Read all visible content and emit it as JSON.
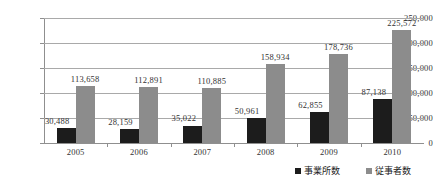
{
  "chart_data": {
    "type": "bar",
    "title": "",
    "subtitle": "",
    "xlabel": "",
    "ylabel": "",
    "categories": [
      "2005",
      "2006",
      "2007",
      "2008",
      "2009",
      "2010"
    ],
    "series": [
      {
        "name": "事業所数",
        "color": "#1c1c1c",
        "values": [
          30488,
          28159,
          35022,
          50961,
          62855,
          87138
        ],
        "labels": [
          "30,488",
          "28,159",
          "35,022",
          "50,961",
          "62,855",
          "87,138"
        ]
      },
      {
        "name": "従事者数",
        "color": "#8c8c8c",
        "values": [
          113658,
          112891,
          110885,
          158934,
          178736,
          225572
        ],
        "labels": [
          "113,658",
          "112,891",
          "110,885",
          "158,934",
          "178,736",
          "225,572"
        ]
      }
    ],
    "ylim": [
      0,
      250000
    ],
    "yticks": [
      0,
      50000,
      100000,
      150000,
      200000,
      250000
    ],
    "ytick_labels": [
      "0",
      "50,000",
      "100,000",
      "150,000",
      "200,000",
      "250,000"
    ],
    "grid": true,
    "legend_position": "bottom-right",
    "annotations": []
  },
  "legend": {
    "entries": [
      {
        "label": "事業所数",
        "swatch": "#1c1c1c"
      },
      {
        "label": "従事者数",
        "swatch": "#8c8c8c"
      }
    ]
  }
}
